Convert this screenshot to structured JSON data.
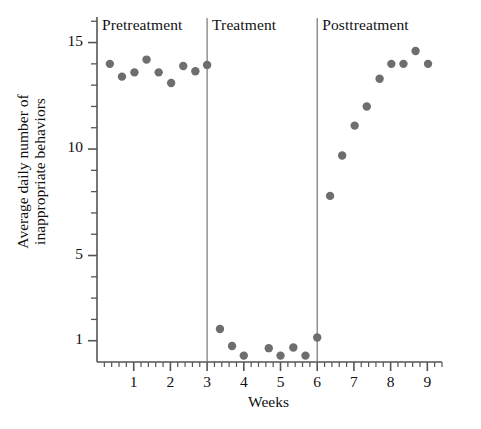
{
  "chart_data": {
    "type": "scatter",
    "title": "",
    "xlabel": "Weeks",
    "ylabel_line1": "Average daily number of",
    "ylabel_line2": "inappropriate behaviors",
    "ylabel": "Average daily number of inappropriate behaviors",
    "xlim": [
      0,
      9.4
    ],
    "ylim": [
      0,
      16.2
    ],
    "xticks": [
      1,
      2,
      3,
      4,
      5,
      6,
      7,
      8,
      9
    ],
    "xtick_labels": [
      "1",
      "2",
      "3",
      "4",
      "5",
      "6",
      "7",
      "8",
      "9"
    ],
    "xminor_step": 0.2,
    "yticks": [
      1,
      5,
      10,
      15
    ],
    "ytick_labels": [
      "1",
      "5",
      "10",
      "15"
    ],
    "yminor_ticks": [
      2,
      3,
      4,
      6,
      7,
      8,
      9,
      11,
      12,
      13,
      14,
      16
    ],
    "grid": false,
    "legend": "none",
    "marker_color": "#6e6e6e",
    "axis_color": "#555555",
    "divider_color": "#777777",
    "marker_size": 6,
    "phase_dividers": [
      3,
      6
    ],
    "phases": [
      {
        "name": "Pretreatment",
        "label": "Pretreatment",
        "x_start": 0,
        "x_end": 3
      },
      {
        "name": "Treatment",
        "label": "Treatment",
        "x_start": 3,
        "x_end": 6
      },
      {
        "name": "Posttreatment",
        "label": "Posttreatment",
        "x_start": 6,
        "x_end": 9.4
      }
    ],
    "series": [
      {
        "name": "Average daily inappropriate behaviors",
        "points": [
          {
            "x": 0.35,
            "y": 14.0,
            "phase": "Pretreatment"
          },
          {
            "x": 0.68,
            "y": 13.4,
            "phase": "Pretreatment"
          },
          {
            "x": 1.02,
            "y": 13.6,
            "phase": "Pretreatment"
          },
          {
            "x": 1.35,
            "y": 14.2,
            "phase": "Pretreatment"
          },
          {
            "x": 1.68,
            "y": 13.6,
            "phase": "Pretreatment"
          },
          {
            "x": 2.02,
            "y": 13.1,
            "phase": "Pretreatment"
          },
          {
            "x": 2.35,
            "y": 13.9,
            "phase": "Pretreatment"
          },
          {
            "x": 2.68,
            "y": 13.65,
            "phase": "Pretreatment"
          },
          {
            "x": 3.0,
            "y": 13.95,
            "phase": "Pretreatment"
          },
          {
            "x": 3.35,
            "y": 1.55,
            "phase": "Treatment"
          },
          {
            "x": 3.68,
            "y": 0.75,
            "phase": "Treatment"
          },
          {
            "x": 4.0,
            "y": 0.3,
            "phase": "Treatment"
          },
          {
            "x": 4.68,
            "y": 0.65,
            "phase": "Treatment"
          },
          {
            "x": 5.0,
            "y": 0.3,
            "phase": "Treatment"
          },
          {
            "x": 5.35,
            "y": 0.68,
            "phase": "Treatment"
          },
          {
            "x": 5.68,
            "y": 0.3,
            "phase": "Treatment"
          },
          {
            "x": 6.0,
            "y": 1.15,
            "phase": "Posttreatment"
          },
          {
            "x": 6.35,
            "y": 7.8,
            "phase": "Posttreatment"
          },
          {
            "x": 6.68,
            "y": 9.7,
            "phase": "Posttreatment"
          },
          {
            "x": 7.02,
            "y": 11.1,
            "phase": "Posttreatment"
          },
          {
            "x": 7.35,
            "y": 12.0,
            "phase": "Posttreatment"
          },
          {
            "x": 7.7,
            "y": 13.3,
            "phase": "Posttreatment"
          },
          {
            "x": 8.02,
            "y": 14.0,
            "phase": "Posttreatment"
          },
          {
            "x": 8.35,
            "y": 14.0,
            "phase": "Posttreatment"
          },
          {
            "x": 8.68,
            "y": 14.6,
            "phase": "Posttreatment"
          },
          {
            "x": 9.02,
            "y": 14.0,
            "phase": "Posttreatment"
          }
        ]
      }
    ]
  }
}
